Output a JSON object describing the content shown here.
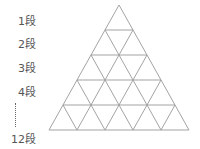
{
  "diagram": {
    "type": "triangular-grid",
    "rows_shown": 5,
    "row_labels": [
      "1段",
      "2段",
      "3段",
      "4段",
      "12段"
    ],
    "ellipsis": "vertical-dots",
    "line_color": "#999999"
  }
}
